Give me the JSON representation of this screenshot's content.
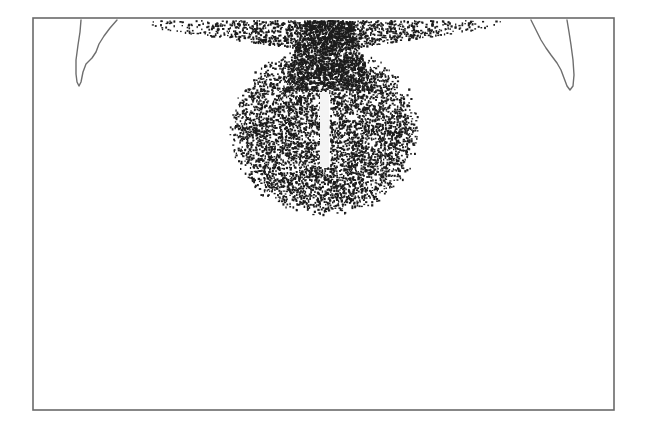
{
  "figure": {
    "width": 649,
    "height": 433,
    "background": "#ffffff",
    "frame": {
      "x": 33,
      "y": 18,
      "width": 581,
      "height": 392,
      "color": "#6a6a6a"
    },
    "left_notch": {
      "points": [
        [
          81,
          20
        ],
        [
          80,
          32
        ],
        [
          78,
          45
        ],
        [
          76,
          60
        ],
        [
          76,
          74
        ],
        [
          77,
          82
        ],
        [
          79,
          86
        ],
        [
          81,
          82
        ],
        [
          83,
          72
        ],
        [
          86,
          64
        ],
        [
          92,
          58
        ],
        [
          96,
          52
        ],
        [
          99,
          44
        ],
        [
          104,
          36
        ],
        [
          110,
          28
        ],
        [
          117,
          20
        ]
      ],
      "color": "#6e6e6e"
    },
    "right_notch": {
      "points": [
        [
          531,
          20
        ],
        [
          536,
          30
        ],
        [
          541,
          40
        ],
        [
          546,
          48
        ],
        [
          551,
          55
        ],
        [
          557,
          63
        ],
        [
          561,
          70
        ],
        [
          564,
          78
        ],
        [
          567,
          86
        ],
        [
          570,
          90
        ],
        [
          573,
          86
        ],
        [
          574,
          75
        ],
        [
          573,
          60
        ],
        [
          571,
          45
        ],
        [
          569,
          32
        ],
        [
          567,
          20
        ]
      ],
      "color": "#6e6e6e"
    },
    "particle_cloud": {
      "color": "#1c1c1c",
      "seed": 7,
      "top_y": 20,
      "band": {
        "x_min": 150,
        "x_max": 500,
        "y_min": 20,
        "y_max": 52,
        "count": 1300,
        "center_x": 322
      },
      "bulb": {
        "cx": 324,
        "cy": 130,
        "rx": 90,
        "ry": 80,
        "count": 5200
      },
      "stem": {
        "x_min": 282,
        "x_max": 372,
        "y_min": 20,
        "y_max": 90,
        "count": 1400
      },
      "dot_size": [
        1.2,
        2.4
      ]
    },
    "slot": {
      "x": 320,
      "y": 92,
      "width": 9,
      "height": 75,
      "color": "#f4f4f4"
    }
  }
}
